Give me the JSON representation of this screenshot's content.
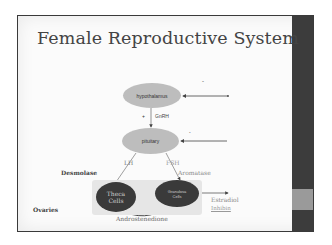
{
  "slide": {
    "title": "Female Reproductive System"
  },
  "diagram": {
    "nodes": {
      "hypothalamus": "hypothalamus",
      "pituitary": "pituitary",
      "theca": "Theca Cells",
      "theca_line1": "Theca",
      "theca_line2": "Cells",
      "granulosa_line1": "Granulosa",
      "granulosa_line2": "Cells"
    },
    "edge_labels": {
      "gnrh_sign": "+",
      "gnrh": "GnRH",
      "lh": "LH",
      "fsh": "FSH",
      "desmolase": "Desmolase",
      "aromatase": "Aromatase",
      "androstenedione": "Androstenedione",
      "estradiol": "Estradiol",
      "inhibin": "Inhibin",
      "ovaries": "Ovaries",
      "feedback_hyp_sign": "-",
      "feedback_pit_sign": "-"
    }
  },
  "colors": {
    "ellipse_gray": "#bdbdbd",
    "cell_dark": "#3a3a3a",
    "sidebar": "#3c3c3c",
    "sidebar_band": "#9a9a9a",
    "ovary_box": "#e6e6e6"
  }
}
